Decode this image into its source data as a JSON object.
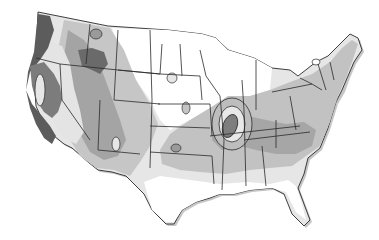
{
  "map": {
    "subject": "Contiguous United States",
    "style": "grayscale contour / isoline shading with state boundaries",
    "colors": {
      "background": "#ffffff",
      "land_white": "#ffffff",
      "level_1": "#e0e0e0",
      "level_2": "#c4c4c4",
      "level_3": "#a8a8a8",
      "level_4": "#828282",
      "level_5": "#5e5e5e",
      "border": "#2a2a2a",
      "shadow": "#9a9a9a"
    },
    "labels": []
  }
}
